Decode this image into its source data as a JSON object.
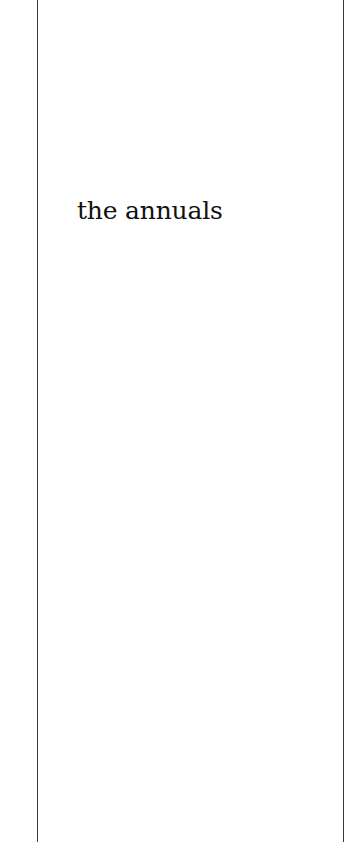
{
  "page": {
    "title": "the annuals"
  }
}
